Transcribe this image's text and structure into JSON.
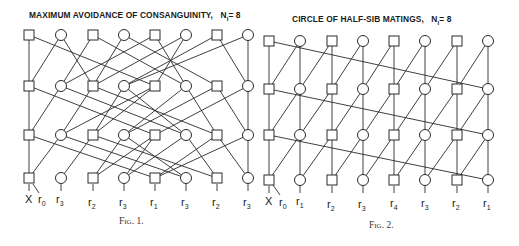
{
  "figure1": {
    "title": "MAXIMUM AVOIDANCE OF CONSANGUINITY,",
    "title_n": "N",
    "title_n_sub": "I",
    "title_n_val": "= 8",
    "caption": "Fig. 1.",
    "bottom_labels": [
      {
        "base": "X",
        "sub": ""
      },
      {
        "base": "r",
        "sub": "0"
      },
      {
        "base": "r",
        "sub": "3"
      },
      {
        "base": "r",
        "sub": "2"
      },
      {
        "base": "r",
        "sub": "3"
      },
      {
        "base": "r",
        "sub": "1"
      },
      {
        "base": "r",
        "sub": "3"
      },
      {
        "base": "r",
        "sub": "2"
      },
      {
        "base": "r",
        "sub": "3"
      }
    ],
    "node_pattern": [
      "square",
      "circle",
      "square",
      "circle",
      "square",
      "circle",
      "square",
      "circle"
    ],
    "rows": 4
  },
  "figure2": {
    "title": "CIRCLE OF HALF-SIB MATINGS,",
    "title_n": "N",
    "title_n_sub": "I",
    "title_n_val": "= 8",
    "caption": "Fig. 2.",
    "bottom_labels": [
      {
        "base": "X",
        "sub": ""
      },
      {
        "base": "r",
        "sub": "0"
      },
      {
        "base": "r",
        "sub": "1"
      },
      {
        "base": "r",
        "sub": "2"
      },
      {
        "base": "r",
        "sub": "3"
      },
      {
        "base": "r",
        "sub": "4"
      },
      {
        "base": "r",
        "sub": "3"
      },
      {
        "base": "r",
        "sub": "2"
      },
      {
        "base": "r",
        "sub": "1"
      }
    ],
    "node_pattern": [
      "square",
      "circle",
      "square",
      "circle",
      "square",
      "circle",
      "square",
      "circle"
    ],
    "rows": 4
  }
}
